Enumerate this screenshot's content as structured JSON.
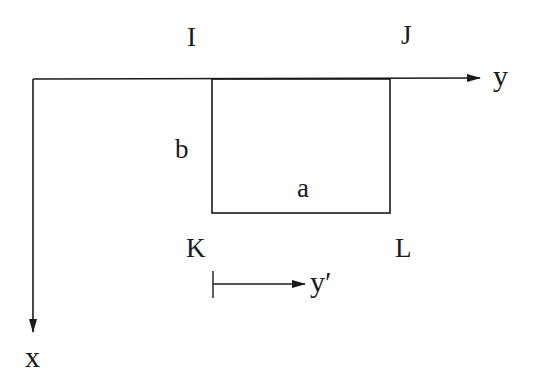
{
  "diagram": {
    "axes": {
      "y_label": "y",
      "x_label": "x",
      "y_prime_label": "y′"
    },
    "corners": {
      "top_left": "I",
      "top_right": "J",
      "bottom_left": "K",
      "bottom_right": "L"
    },
    "dimensions": {
      "width_label": "a",
      "height_label": "b"
    },
    "colors": {
      "stroke": "#1a1a1a",
      "background": "#ffffff"
    }
  }
}
